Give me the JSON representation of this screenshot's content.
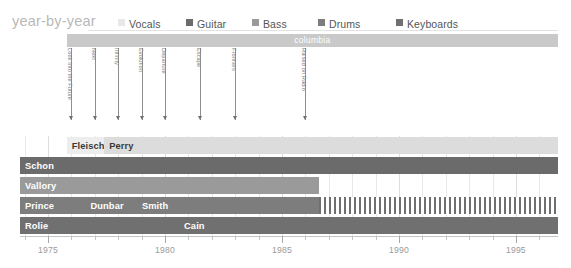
{
  "header": {
    "title": "year-by-year",
    "legend": [
      {
        "label": "Vocals",
        "color": "#e8e8e8"
      },
      {
        "label": "Guitar",
        "color": "#6b6b6b"
      },
      {
        "label": "Bass",
        "color": "#9a9a9a"
      },
      {
        "label": "Drums",
        "color": "#7d7d7d"
      },
      {
        "label": "Keyboards",
        "color": "#707070"
      }
    ]
  },
  "label_band": {
    "name": "columbia",
    "start_year": 1975.8,
    "end_year": 1996.8
  },
  "albums": [
    {
      "title": "Look Into the Future",
      "year": 1976.0
    },
    {
      "title": "Next",
      "year": 1977.0
    },
    {
      "title": "Infinity",
      "year": 1978.0
    },
    {
      "title": "Evolution",
      "year": 1979.0
    },
    {
      "title": "Departure",
      "year": 1980.0
    },
    {
      "title": "Escape",
      "year": 1981.5
    },
    {
      "title": "Frontiers",
      "year": 1983.0
    },
    {
      "title": "Raised on Radio",
      "year": 1986.0
    }
  ],
  "axis": {
    "start_year": 1973.8,
    "end_year": 1996.8,
    "tick_interval": 1,
    "major_interval": 5,
    "major_labels": [
      "1975",
      "1980",
      "1985",
      "1990",
      "1995"
    ],
    "major_values": [
      1975,
      1980,
      1985,
      1990,
      1995
    ]
  },
  "chart_data": {
    "type": "bar",
    "title": "year-by-year",
    "xlabel": "",
    "ylabel": "",
    "xlim": [
      1973.8,
      1996.8
    ],
    "grid": true,
    "legend_position": "top",
    "rows": [
      {
        "role": "Vocals",
        "color": "#e8e8e8",
        "segments": [
          {
            "name": "Fleischman",
            "start": 1975.8,
            "end": 1977.4,
            "color": "#ededed",
            "text": "dark"
          },
          {
            "name": "Perry",
            "start": 1977.4,
            "end": 1996.8,
            "color": "#dcdcdc",
            "text": "dark"
          }
        ]
      },
      {
        "role": "Guitar",
        "color": "#6b6b6b",
        "segments": [
          {
            "name": "Tickner",
            "start": 1973.8,
            "end": 1976.1,
            "color": "#6b6b6b",
            "text": "light"
          },
          {
            "name": "Schon",
            "start": 1973.8,
            "end": 1996.8,
            "color": "#6b6b6b",
            "text": "light"
          }
        ]
      },
      {
        "role": "Bass",
        "color": "#9a9a9a",
        "segments": [
          {
            "name": "Vallory",
            "start": 1973.8,
            "end": 1986.6,
            "color": "#9a9a9a",
            "text": "light"
          }
        ]
      },
      {
        "role": "Drums",
        "color": "#7d7d7d",
        "segments": [
          {
            "name": "Prince",
            "start": 1973.8,
            "end": 1976.6,
            "color": "#7d7d7d",
            "text": "light"
          },
          {
            "name": "Dunbar",
            "start": 1976.6,
            "end": 1978.8,
            "color": "#7d7d7d",
            "text": "light"
          },
          {
            "name": "Smith",
            "start": 1978.8,
            "end": 1986.6,
            "color": "#7d7d7d",
            "text": "light"
          },
          {
            "name": "",
            "start": 1986.6,
            "end": 1996.8,
            "color": "hatch",
            "text": "light"
          }
        ]
      },
      {
        "role": "Keyboards",
        "color": "#707070",
        "segments": [
          {
            "name": "Rolie",
            "start": 1973.8,
            "end": 1980.6,
            "color": "#707070",
            "text": "light"
          },
          {
            "name": "Cain",
            "start": 1980.6,
            "end": 1996.8,
            "color": "#707070",
            "text": "light"
          }
        ]
      }
    ]
  }
}
